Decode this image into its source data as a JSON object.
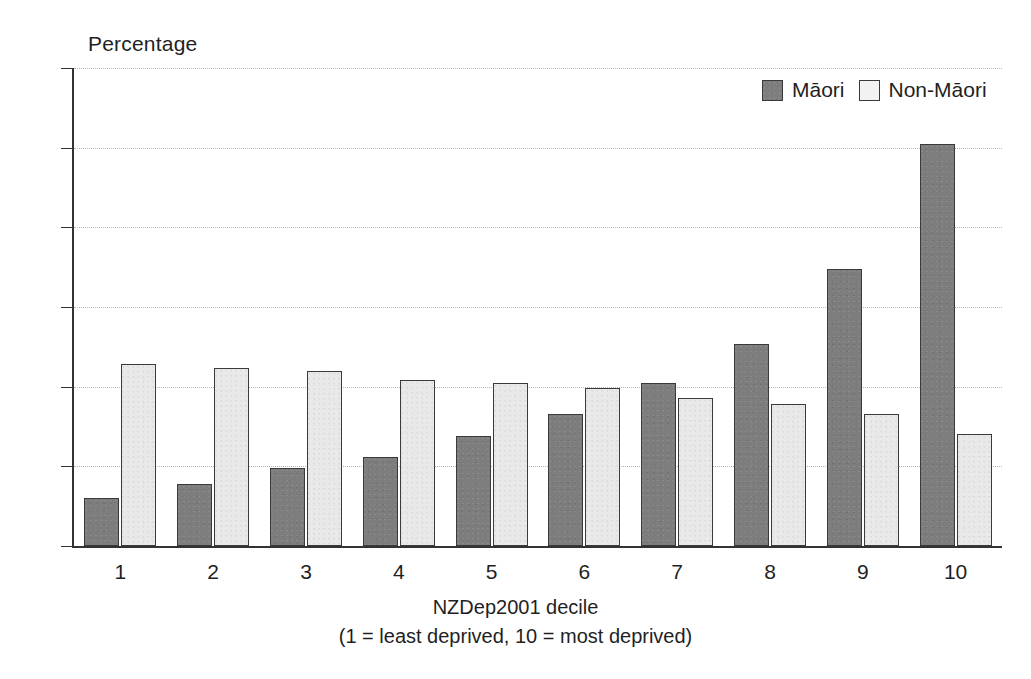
{
  "chart_data": {
    "type": "bar",
    "title": "",
    "ylabel": "Percentage",
    "xlabel": "NZDep2001 decile",
    "xlabel_sub": "(1 = least deprived, 10 = most deprived)",
    "categories": [
      "1",
      "2",
      "3",
      "4",
      "5",
      "6",
      "7",
      "8",
      "9",
      "10"
    ],
    "series": [
      {
        "name": "Māori",
        "color": "#7d7d7d",
        "values": [
          3.0,
          3.9,
          4.9,
          5.6,
          6.9,
          8.3,
          10.2,
          12.7,
          17.4,
          25.2
        ]
      },
      {
        "name": "Non-Māori",
        "color": "#e9e9e9",
        "values": [
          11.4,
          11.2,
          11.0,
          10.4,
          10.2,
          9.9,
          9.3,
          8.9,
          8.3,
          7.0
        ]
      }
    ],
    "ylim": [
      0,
      30
    ],
    "yticks": [
      "0",
      "5",
      "10",
      "15",
      "20",
      "25",
      "30"
    ],
    "ytick_values": [
      0,
      5,
      10,
      15,
      20,
      25,
      30
    ],
    "grid": true,
    "grid_style": "dotted-horizontal",
    "legend_position": "top-right"
  },
  "legend": {
    "items": [
      {
        "label": "Māori",
        "swatch": "dark-gray-filled-square"
      },
      {
        "label": "Non-Māori",
        "swatch": "light-gray-outlined-square"
      }
    ]
  },
  "colors": {
    "maori": "#7d7d7d",
    "non_maori": "#e9e9e9",
    "axis": "#333333",
    "grid": "#b4b4b4",
    "background": "#ffffff"
  }
}
